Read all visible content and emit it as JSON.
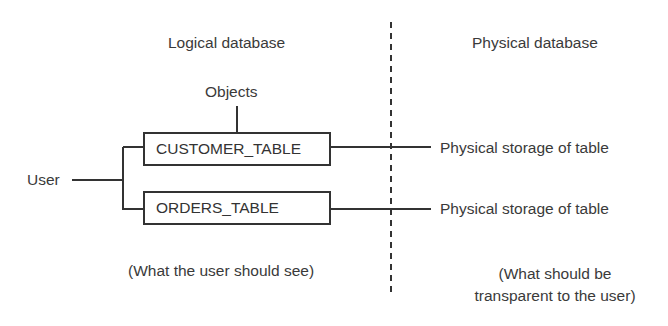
{
  "diagram": {
    "logical_heading": "Logical database",
    "physical_heading": "Physical database",
    "objects_label": "Objects",
    "user_label": "User",
    "tables": [
      {
        "name": "CUSTOMER_TABLE",
        "storage_label": "Physical storage of table"
      },
      {
        "name": "ORDERS_TABLE",
        "storage_label": "Physical storage of table"
      }
    ],
    "logical_caption": "(What the user should see)",
    "physical_caption_line1": "(What should be",
    "physical_caption_line2": "transparent to the user)"
  }
}
